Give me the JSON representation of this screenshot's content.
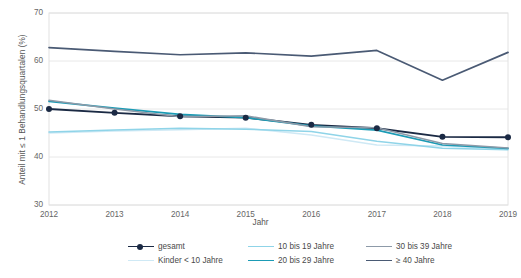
{
  "axes": {
    "ylabel": "Anteil mit ≤ 1 Behandlungsquartalen (%)",
    "xlabel": "Jahr",
    "yticks": [
      "30",
      "40",
      "50",
      "60",
      "70"
    ],
    "xticks": [
      "2012",
      "2013",
      "2014",
      "2015",
      "2016",
      "2017",
      "2018",
      "2019"
    ]
  },
  "legend": {
    "items": [
      {
        "label": "gesamt",
        "color": "#1b2a44",
        "marker": true
      },
      {
        "label": "10 bis 19 Jahre",
        "color": "#8fd4e8",
        "marker": false
      },
      {
        "label": "30 bis 39 Jahre",
        "color": "#8d9aa8",
        "marker": false
      },
      {
        "label": "Kinder < 10 Jahre",
        "color": "#cfe9f5",
        "marker": false
      },
      {
        "label": "20 bis 29 Jahre",
        "color": "#1b9bb5",
        "marker": false
      },
      {
        "label": "≥ 40 Jahre",
        "color": "#4a5a74",
        "marker": false
      }
    ]
  },
  "chart_data": {
    "type": "line",
    "title": "",
    "xlabel": "Jahr",
    "ylabel": "Anteil mit ≤ 1 Behandlungsquartalen (%)",
    "x": [
      2012,
      2013,
      2014,
      2015,
      2016,
      2017,
      2018,
      2019
    ],
    "ylim": [
      30,
      70
    ],
    "xlim": [
      2012,
      2019
    ],
    "yticks": [
      30,
      40,
      50,
      60,
      70
    ],
    "grid": true,
    "legend_position": "bottom",
    "series": [
      {
        "name": "gesamt",
        "color": "#1b2a44",
        "width": 1.9,
        "marker": true,
        "values": [
          50.0,
          49.2,
          48.5,
          48.2,
          46.7,
          46.0,
          44.2,
          44.1
        ]
      },
      {
        "name": "Kinder < 10 Jahre",
        "color": "#cfe9f5",
        "width": 1.5,
        "marker": false,
        "values": [
          45.0,
          45.4,
          45.7,
          46.0,
          44.6,
          42.5,
          42.3,
          41.6
        ]
      },
      {
        "name": "10 bis 19 Jahre",
        "color": "#8fd4e8",
        "width": 1.5,
        "marker": false,
        "values": [
          45.2,
          45.6,
          46.0,
          45.8,
          45.3,
          43.3,
          41.8,
          41.5
        ]
      },
      {
        "name": "20 bis 29 Jahre",
        "color": "#1b9bb5",
        "width": 1.7,
        "marker": false,
        "values": [
          51.6,
          50.2,
          48.9,
          48.2,
          46.5,
          45.6,
          42.5,
          41.8
        ]
      },
      {
        "name": "30 bis 39 Jahre",
        "color": "#8d9aa8",
        "width": 1.5,
        "marker": false,
        "values": [
          51.8,
          50.0,
          48.4,
          48.6,
          46.3,
          46.1,
          42.8,
          41.9
        ]
      },
      {
        "name": "≥ 40 Jahre",
        "color": "#4a5a74",
        "width": 1.7,
        "marker": false,
        "values": [
          62.8,
          62.0,
          61.3,
          61.7,
          61.0,
          62.2,
          56.0,
          61.8
        ]
      }
    ]
  }
}
